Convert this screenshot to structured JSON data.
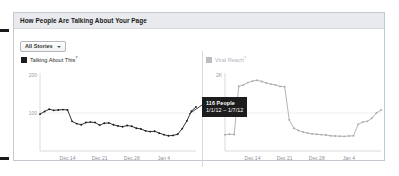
{
  "panel": {
    "title": "How People Are Talking About Your Page"
  },
  "filter": {
    "label": "All Stories",
    "caret_icon": "chevron-down-icon"
  },
  "legends": [
    {
      "label": "Talking About This",
      "superscript": "?",
      "swatch_color": "#1d1d1d",
      "muted": false
    },
    {
      "label": "Viral Reach",
      "superscript": "?",
      "swatch_color": "#b9bcc1",
      "muted": true
    }
  ],
  "tooltip": {
    "value_label": "116 People",
    "date_range": "1/1/12 – 1/7/12",
    "background": "#1c1c1c",
    "text_color": "#ffffff"
  },
  "chart_data": [
    {
      "id": "talking-about-this",
      "type": "line",
      "title": "Talking About This",
      "xlabel": "",
      "ylabel": "",
      "grid": true,
      "legend_position": "above-left",
      "series_color": "#1d1d1d",
      "marker": "circle",
      "ylim": [
        0,
        200
      ],
      "ytick_labels": [
        "200",
        "100"
      ],
      "yticks": [
        200,
        100
      ],
      "xtick_labels": [
        "Dec 14",
        "Dec 21",
        "Dec 28",
        "Jan 4"
      ],
      "xticks": [
        6,
        13,
        20,
        27
      ],
      "x": [
        0,
        1,
        2,
        3,
        4,
        5,
        6,
        7,
        8,
        9,
        10,
        11,
        12,
        13,
        14,
        15,
        16,
        17,
        18,
        19,
        20,
        21,
        22,
        23,
        24,
        25,
        26,
        27,
        28,
        29,
        30,
        31,
        32,
        33,
        34
      ],
      "values": [
        97,
        104,
        110,
        107,
        108,
        109,
        108,
        78,
        72,
        69,
        75,
        76,
        75,
        68,
        73,
        74,
        69,
        66,
        64,
        67,
        65,
        60,
        58,
        53,
        51,
        52,
        47,
        43,
        40,
        41,
        44,
        59,
        79,
        105,
        116
      ]
    },
    {
      "id": "viral-reach",
      "type": "line",
      "title": "Viral Reach",
      "xlabel": "",
      "ylabel": "",
      "grid": true,
      "legend_position": "above-left",
      "series_color": "#a8abb0",
      "marker": "circle",
      "ylim": [
        0,
        2000
      ],
      "ytick_labels": [
        "2K",
        "1K"
      ],
      "yticks": [
        2000,
        1000
      ],
      "xtick_labels": [
        "Dec 14",
        "Dec 21",
        "Dec 28",
        "Jan 4"
      ],
      "xticks": [
        6,
        13,
        20,
        27
      ],
      "x": [
        0,
        1,
        2,
        3,
        4,
        5,
        6,
        7,
        8,
        9,
        10,
        11,
        12,
        13,
        14,
        15,
        16,
        17,
        18,
        19,
        20,
        21,
        22,
        23,
        24,
        25,
        26,
        27,
        28,
        29,
        30,
        31,
        32,
        33,
        34
      ],
      "values": [
        430,
        440,
        435,
        1700,
        1740,
        1800,
        1840,
        1860,
        1830,
        1790,
        1760,
        1740,
        1700,
        1690,
        820,
        600,
        540,
        500,
        470,
        450,
        440,
        430,
        420,
        400,
        395,
        390,
        385,
        395,
        400,
        700,
        760,
        780,
        860,
        1000,
        1080
      ]
    }
  ]
}
